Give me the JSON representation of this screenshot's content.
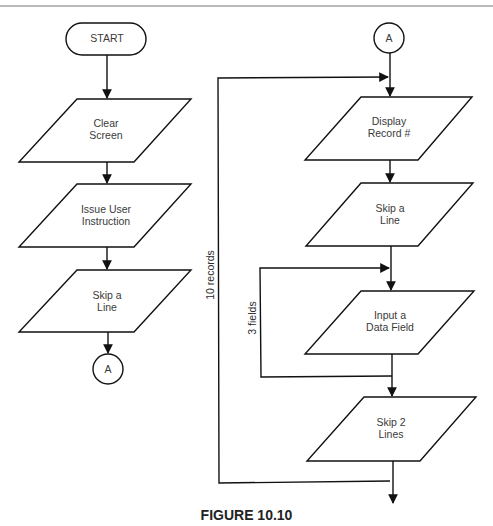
{
  "figure": {
    "caption": "FIGURE 10.10",
    "colors": {
      "line": "#111111",
      "text": "#3a3a3a",
      "background": "#ffffff"
    }
  },
  "left_flow": {
    "start": {
      "label": "START",
      "shape": "terminator"
    },
    "steps": [
      {
        "line1": "Clear",
        "line2": "Screen",
        "shape": "parallelogram"
      },
      {
        "line1": "Issue User",
        "line2": "Instruction",
        "shape": "parallelogram"
      },
      {
        "line1": "Skip a",
        "line2": "Line",
        "shape": "parallelogram"
      }
    ],
    "connector": {
      "label": "A",
      "shape": "circle-connector"
    }
  },
  "right_flow": {
    "connector": {
      "label": "A",
      "shape": "circle-connector"
    },
    "steps": [
      {
        "line1": "Display",
        "line2": "Record #",
        "shape": "parallelogram"
      },
      {
        "line1": "Skip a",
        "line2": "Line",
        "shape": "parallelogram"
      },
      {
        "line1": "Input a",
        "line2": "Data Field",
        "shape": "parallelogram"
      },
      {
        "line1": "Skip 2",
        "line2": "Lines",
        "shape": "parallelogram"
      }
    ],
    "outer_loop_label": "10 records",
    "inner_loop_label": "3 fields"
  }
}
